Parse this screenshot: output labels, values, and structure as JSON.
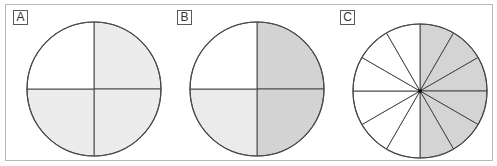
{
  "panels": [
    {
      "label": "A",
      "center": [
        94,
        89
      ],
      "radius": 67,
      "segments": 4,
      "fills": [
        "#ececec",
        "#ececec",
        "#ececec",
        "#ffffff"
      ],
      "description": "Circle divided into 4 equal parts, 3 shaded light gray"
    },
    {
      "label": "B",
      "center": [
        257,
        89
      ],
      "radius": 67,
      "segments": 4,
      "fills": [
        "#d3d3d3",
        "#d3d3d3",
        "#ebebeb",
        "#ffffff"
      ],
      "description": "Circle divided into 4 equal parts, right half dark gray, bottom-left light gray"
    },
    {
      "label": "C",
      "center": [
        420,
        91
      ],
      "radius": 67,
      "segments": 12,
      "fills": [
        "#d4d4d4",
        "#d4d4d4",
        "#d4d4d4",
        "#d4d4d4",
        "#d4d4d4",
        "#d4d4d4",
        "#ffffff",
        "#ffffff",
        "#ffffff",
        "#ffffff",
        "#ffffff",
        "#ffffff"
      ],
      "description": "Circle divided into 12 equal parts, right 6 shaded gray"
    }
  ],
  "colors": {
    "stroke": "#4a4a4a",
    "frame": "#b8b8b8"
  }
}
